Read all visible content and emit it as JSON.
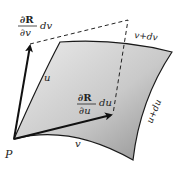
{
  "diagram": {
    "point_label": "P",
    "u_curve_label": "u",
    "v_curve_label": "v",
    "u_plus_du_label": "u+du",
    "v_plus_dv_label": "v+dv",
    "vector_v": {
      "numerator": "∂R",
      "denominator": "∂v",
      "differential": "dv"
    },
    "vector_u": {
      "numerator": "∂R",
      "denominator": "∂u",
      "differential": "du"
    },
    "colors": {
      "surface_light": "#e8e8e8",
      "surface_dark": "#9a9a9a",
      "edge": "#1a1a1a",
      "arrow": "#111111"
    }
  }
}
